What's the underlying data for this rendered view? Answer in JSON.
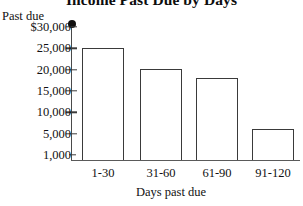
{
  "chart_data": {
    "type": "bar",
    "title": "Income Past Due by Days",
    "xlabel": "Days past due",
    "ylabel": "Past due",
    "categories": [
      "1-30",
      "31-60",
      "61-90",
      "91-120"
    ],
    "values": [
      25000,
      20200,
      18000,
      6000
    ],
    "ytick_labels": [
      "$30,000",
      "25,000",
      "20,000",
      "15,000",
      "10,000",
      "5,000",
      "1,000"
    ],
    "ytick_values": [
      30000,
      25000,
      20000,
      15000,
      10000,
      5000,
      1000
    ],
    "ylim": [
      0,
      30000
    ],
    "grid": false,
    "legend": "none",
    "bar_style": {
      "fill": "#ffffff",
      "outline": "#3a3a3a"
    },
    "axis_color": "#4a4a4a",
    "text_color": "#111111"
  }
}
